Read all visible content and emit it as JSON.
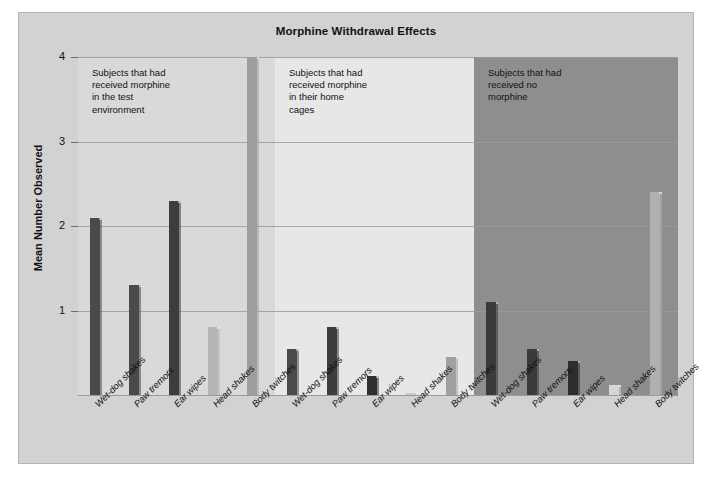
{
  "figure": {
    "title": "Morphine Withdrawal Effects",
    "y_axis_title": "Mean Number Observed"
  },
  "panels": [
    {
      "id": "panel-0",
      "note": "Subjects that had\nreceived morphine\nin the test\nenvironment",
      "bg": "#d9d9d9"
    },
    {
      "id": "panel-1",
      "note": "Subjects that had\nreceived morphine\nin their home\ncages",
      "bg": "#e7e7e7"
    },
    {
      "id": "panel-2",
      "note": "Subjects that had\nreceived no\nmorphine",
      "bg": "#8e8e8e"
    }
  ],
  "axis": {
    "yticks": [
      "1",
      "2",
      "3",
      "4"
    ],
    "ytick_values": [
      1,
      2,
      3,
      4
    ],
    "ymin": 0,
    "ymax": 4
  },
  "chart_data": {
    "type": "bar",
    "title": "Morphine Withdrawal Effects",
    "xlabel": "",
    "ylabel": "Mean Number Observed",
    "ylim": [
      0,
      4
    ],
    "yticks": [
      1,
      2,
      3,
      4
    ],
    "grid": true,
    "legend": "none",
    "categories": [
      "Wet-dog shakes",
      "Paw tremors",
      "Ear wipes",
      "Head shakes",
      "Body twitches"
    ],
    "groups": [
      {
        "name": "Subjects that had received morphine in the test environment",
        "panel_background": "#d9d9d9",
        "values": [
          2.1,
          1.3,
          2.3,
          0.8,
          4.0
        ],
        "bar_colors": [
          "#4a4a4a",
          "#4a4a4a",
          "#3d3d3d",
          "#b5b5b5",
          "#9e9e9e"
        ]
      },
      {
        "name": "Subjects that had received morphine in their home cages",
        "panel_background": "#e7e7e7",
        "values": [
          0.55,
          0.8,
          0.22,
          0.02,
          0.45
        ],
        "bar_colors": [
          "#4a4a4a",
          "#3d3d3d",
          "#2f2f2f",
          "#c8c8c8",
          "#a0a0a0"
        ]
      },
      {
        "name": "Subjects that had received no morphine",
        "panel_background": "#8e8e8e",
        "values": [
          1.1,
          0.55,
          0.4,
          0.12,
          2.4
        ],
        "bar_colors": [
          "#3a3a3a",
          "#3a3a3a",
          "#2d2d2d",
          "#d6d6d6",
          "#b0b0b0"
        ]
      }
    ]
  },
  "xtick_labels": [
    "Wet-dog shakes",
    "Paw tremors",
    "Ear wipes",
    "Head shakes",
    "Body twitches",
    "Wet-dog shakes",
    "Paw tremors",
    "Ear wipes",
    "Head shakes",
    "Body twitches",
    "Wet-dog shakes",
    "Paw tremors",
    "Ear wipes",
    "Head shakes",
    "Body twitches"
  ]
}
